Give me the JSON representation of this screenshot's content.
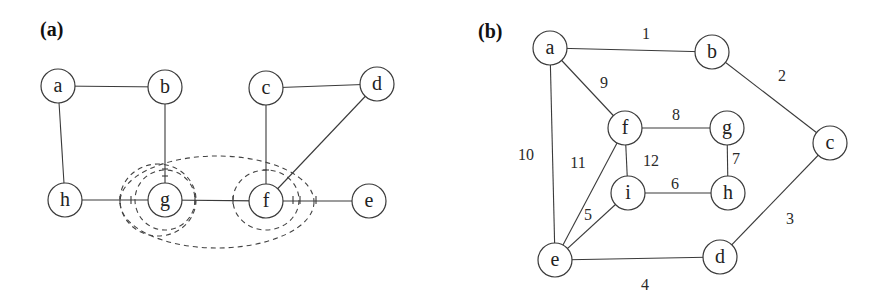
{
  "panels": [
    {
      "id": "a",
      "label": "(a)",
      "nodes": [
        {
          "id": "a",
          "label": "a",
          "x": 58,
          "y": 86
        },
        {
          "id": "b",
          "label": "b",
          "x": 165,
          "y": 87
        },
        {
          "id": "c",
          "label": "c",
          "x": 266,
          "y": 88
        },
        {
          "id": "d",
          "label": "d",
          "x": 377,
          "y": 84
        },
        {
          "id": "h",
          "label": "h",
          "x": 65,
          "y": 200
        },
        {
          "id": "g",
          "label": "g",
          "x": 165,
          "y": 200
        },
        {
          "id": "f",
          "label": "f",
          "x": 266,
          "y": 201
        },
        {
          "id": "e",
          "label": "e",
          "x": 369,
          "y": 201
        }
      ],
      "edges": [
        {
          "from": "a",
          "to": "b"
        },
        {
          "from": "a",
          "to": "h"
        },
        {
          "from": "b",
          "to": "g"
        },
        {
          "from": "c",
          "to": "d"
        },
        {
          "from": "c",
          "to": "f"
        },
        {
          "from": "d",
          "to": "f"
        },
        {
          "from": "h",
          "to": "g"
        },
        {
          "from": "g",
          "to": "f"
        },
        {
          "from": "f",
          "to": "e"
        }
      ],
      "dashed_regions": [
        {
          "name": "g-inner",
          "cx": 165,
          "cy": 200,
          "rx": 30,
          "ry": 30
        },
        {
          "name": "g-outer",
          "cx": 158,
          "cy": 200,
          "rx": 38,
          "ry": 36
        },
        {
          "name": "f-inner",
          "cx": 266,
          "cy": 200,
          "rx": 33,
          "ry": 30
        },
        {
          "name": "gf-outer",
          "cx": 217,
          "cy": 202,
          "rx": 97,
          "ry": 46
        }
      ]
    },
    {
      "id": "b",
      "label": "(b)",
      "nodes": [
        {
          "id": "a",
          "label": "a",
          "x": 550,
          "y": 48
        },
        {
          "id": "b",
          "label": "b",
          "x": 712,
          "y": 52
        },
        {
          "id": "c",
          "label": "c",
          "x": 830,
          "y": 143
        },
        {
          "id": "f",
          "label": "f",
          "x": 625,
          "y": 128
        },
        {
          "id": "g",
          "label": "g",
          "x": 727,
          "y": 128
        },
        {
          "id": "i",
          "label": "i",
          "x": 628,
          "y": 193
        },
        {
          "id": "h",
          "label": "h",
          "x": 728,
          "y": 193
        },
        {
          "id": "e",
          "label": "e",
          "x": 555,
          "y": 260
        },
        {
          "id": "d",
          "label": "d",
          "x": 720,
          "y": 257
        }
      ],
      "edges": [
        {
          "from": "a",
          "to": "b",
          "weight": "1",
          "lx": 646,
          "ly": 33
        },
        {
          "from": "b",
          "to": "c",
          "weight": "2",
          "lx": 782,
          "ly": 75
        },
        {
          "from": "c",
          "to": "d",
          "weight": "3",
          "lx": 790,
          "ly": 218
        },
        {
          "from": "e",
          "to": "d",
          "weight": "4",
          "lx": 645,
          "ly": 284
        },
        {
          "from": "e",
          "to": "i",
          "weight": "5",
          "lx": 588,
          "ly": 214
        },
        {
          "from": "i",
          "to": "h",
          "weight": "6",
          "lx": 675,
          "ly": 183
        },
        {
          "from": "g",
          "to": "h",
          "weight": "7",
          "lx": 736,
          "ly": 158
        },
        {
          "from": "f",
          "to": "g",
          "weight": "8",
          "lx": 676,
          "ly": 114
        },
        {
          "from": "a",
          "to": "f",
          "weight": "9",
          "lx": 604,
          "ly": 82
        },
        {
          "from": "a",
          "to": "e",
          "weight": "10",
          "lx": 526,
          "ly": 154
        },
        {
          "from": "e",
          "to": "f",
          "weight": "11",
          "lx": 578,
          "ly": 162
        },
        {
          "from": "f",
          "to": "i",
          "weight": "12",
          "lx": 651,
          "ly": 160
        }
      ]
    }
  ]
}
